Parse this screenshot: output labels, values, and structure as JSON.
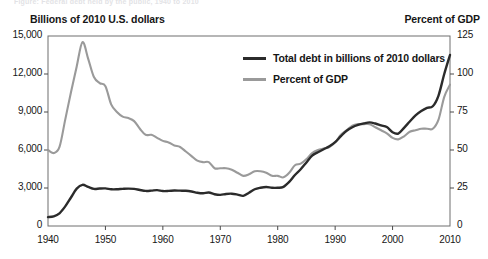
{
  "figure": {
    "ghost_header": "Figure: Federal debt held by the public, 1940 to 2010",
    "width": 488,
    "height": 259,
    "background": "#ffffff"
  },
  "axis_titles": {
    "left": "Billions of 2010 U.S. dollars",
    "right": "Percent of GDP"
  },
  "legend": {
    "items": [
      {
        "label": "Total debt in billions of 2010 dollars",
        "color": "#2b2b2b"
      },
      {
        "label": "Percent of GDP",
        "color": "#9a9a9a"
      }
    ]
  },
  "chart_data": {
    "type": "line",
    "title": "",
    "subtitle": "",
    "xlabel": "",
    "ylabel": "Billions of 2010 U.S. dollars",
    "ylabel_secondary": "Percent of GDP",
    "xlim": [
      1940,
      2010
    ],
    "ylim": [
      0,
      15000
    ],
    "ylim_secondary": [
      0,
      125
    ],
    "grid": false,
    "legend_position": "inside-top-center",
    "xticks": [
      1940,
      1950,
      1960,
      1970,
      1980,
      1990,
      2000,
      2010
    ],
    "xticklabels": [
      "1940",
      "1950",
      "1960",
      "1970",
      "1980",
      "1990",
      "2000",
      "2010"
    ],
    "yticks": [
      0,
      3000,
      6000,
      9000,
      12000,
      15000
    ],
    "yticklabels": [
      "0",
      "3,000",
      "6,000",
      "9,000",
      "12,000",
      "15,000"
    ],
    "yticks_secondary": [
      0,
      25,
      50,
      75,
      100,
      125
    ],
    "yticklabels_secondary": [
      "0",
      "25",
      "50",
      "75",
      "100",
      "125"
    ],
    "x": [
      1940,
      1941,
      1942,
      1943,
      1944,
      1945,
      1946,
      1947,
      1948,
      1949,
      1950,
      1951,
      1952,
      1953,
      1954,
      1955,
      1956,
      1957,
      1958,
      1959,
      1960,
      1961,
      1962,
      1963,
      1964,
      1965,
      1966,
      1967,
      1968,
      1969,
      1970,
      1971,
      1972,
      1973,
      1974,
      1975,
      1976,
      1977,
      1978,
      1979,
      1980,
      1981,
      1982,
      1983,
      1984,
      1985,
      1986,
      1987,
      1988,
      1989,
      1990,
      1991,
      1992,
      1993,
      1994,
      1995,
      1996,
      1997,
      1998,
      1999,
      2000,
      2001,
      2002,
      2003,
      2004,
      2005,
      2006,
      2007,
      2008,
      2009,
      2010
    ],
    "series": [
      {
        "name": "Total debt in billions of 2010 dollars",
        "axis": "left",
        "color": "#2b2b2b",
        "units": "billions of 2010 dollars",
        "values": [
          700,
          760,
          1000,
          1550,
          2250,
          2950,
          3250,
          3080,
          2930,
          2960,
          2970,
          2900,
          2900,
          2930,
          2950,
          2930,
          2840,
          2770,
          2790,
          2830,
          2760,
          2770,
          2800,
          2790,
          2780,
          2720,
          2620,
          2580,
          2640,
          2510,
          2460,
          2530,
          2550,
          2480,
          2380,
          2620,
          2900,
          3020,
          3080,
          3020,
          3020,
          3090,
          3480,
          4030,
          4480,
          5020,
          5560,
          5820,
          6060,
          6290,
          6620,
          7090,
          7520,
          7800,
          7980,
          8100,
          8180,
          8090,
          7940,
          7810,
          7400,
          7300,
          7750,
          8250,
          8730,
          9070,
          9330,
          9450,
          10300,
          12000,
          13500
        ]
      },
      {
        "name": "Percent of GDP",
        "axis": "right",
        "color": "#9a9a9a",
        "units": "percent of GDP",
        "values": [
          50,
          48,
          52,
          70,
          88,
          105,
          121,
          110,
          98,
          94,
          92,
          80,
          75,
          72,
          71,
          69,
          64,
          60,
          60,
          58,
          56,
          55,
          53,
          52,
          49,
          46,
          43,
          42,
          42,
          38,
          38,
          38,
          37,
          35,
          33,
          34,
          36,
          36,
          35,
          33,
          33,
          32,
          35,
          40,
          41,
          44,
          48,
          50,
          51,
          52,
          55,
          60,
          63,
          66,
          67,
          67,
          67,
          65,
          63,
          61,
          58,
          57,
          59,
          62,
          63,
          64,
          64,
          64,
          70,
          85,
          93
        ]
      }
    ]
  }
}
